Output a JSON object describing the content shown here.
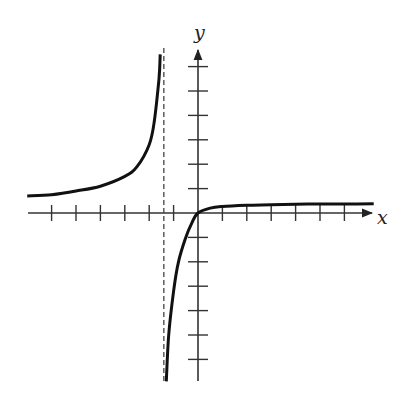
{
  "chart_data": {
    "type": "line",
    "title": "",
    "xlabel": "x",
    "ylabel": "y",
    "grid": false,
    "legend": null,
    "tick_labels": "none (unlabeled ticks)",
    "x_ticks": [
      -6,
      -5,
      -4,
      -3,
      -2,
      -1,
      1,
      2,
      3,
      4,
      5,
      6
    ],
    "y_ticks": [
      -6,
      -5,
      -4,
      -3,
      -2,
      -1,
      1,
      2,
      3,
      4,
      5,
      6
    ],
    "xlim": [
      -7,
      7.2
    ],
    "ylim": [
      -6.9,
      6.6
    ],
    "vertical_asymptote": {
      "x": -1.4,
      "style": "dashed"
    },
    "horizontal_asymptote_approx": 0.4,
    "series": [
      {
        "name": "left-branch",
        "x": [
          -7,
          -6,
          -5,
          -4,
          -3,
          -2.5,
          -2,
          -1.8,
          -1.6,
          -1.55
        ],
        "y": [
          0.7,
          0.75,
          0.9,
          1.1,
          1.5,
          1.9,
          2.8,
          3.7,
          5.5,
          6.5
        ]
      },
      {
        "name": "right-branch",
        "x": [
          -1.3,
          -1.2,
          -1.0,
          -0.8,
          -0.5,
          -0.25,
          0,
          0.5,
          1,
          2,
          3,
          4,
          5,
          6,
          7.2
        ],
        "y": [
          -6.9,
          -5.0,
          -3.2,
          -2.0,
          -1.0,
          -0.4,
          0,
          0.2,
          0.27,
          0.32,
          0.34,
          0.36,
          0.37,
          0.37,
          0.38
        ]
      }
    ]
  },
  "labels": {
    "x_axis": "x",
    "y_axis": "y"
  },
  "colors": {
    "curve": "#111111",
    "axis": "#333333",
    "asymptote": "#444444"
  }
}
